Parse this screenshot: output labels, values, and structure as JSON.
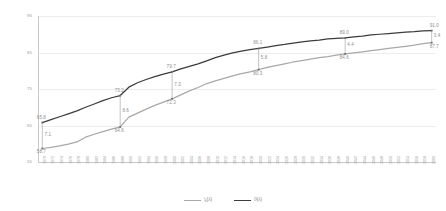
{
  "chart_data": {
    "type": "line",
    "title": "",
    "xlabel": "",
    "ylabel": "",
    "ylim": [
      55,
      95
    ],
    "yticks": [
      95,
      85,
      75,
      65,
      55
    ],
    "grid": true,
    "legend_position": "bottom-center",
    "x": [
      1970,
      1972,
      1974,
      1976,
      1978,
      1980,
      1982,
      1984,
      1986,
      1988,
      1990,
      1992,
      1994,
      1996,
      1998,
      2000,
      2002,
      2004,
      2006,
      2008,
      2010,
      2012,
      2014,
      2016,
      2018,
      2020,
      2022,
      2024,
      2026,
      2028,
      2030,
      2032,
      2034,
      2036,
      2038,
      2040,
      2042,
      2044,
      2046,
      2048,
      2050,
      2052,
      2054,
      2056,
      2058,
      2060
    ],
    "series": [
      {
        "name": "여자",
        "color": "#3c3c3c",
        "values": [
          65.8,
          66.6,
          67.4,
          68.2,
          69.0,
          70.0,
          70.9,
          71.8,
          72.6,
          73.2,
          75.5,
          76.7,
          77.6,
          78.4,
          79.1,
          79.7,
          80.5,
          81.2,
          81.9,
          82.7,
          83.6,
          84.3,
          84.9,
          85.4,
          85.8,
          86.1,
          86.5,
          86.9,
          87.2,
          87.6,
          87.9,
          88.2,
          88.4,
          88.7,
          88.9,
          89.0,
          89.3,
          89.5,
          89.8,
          90.0,
          90.2,
          90.4,
          90.6,
          90.7,
          90.9,
          91.0
        ]
      },
      {
        "name": "남자",
        "color": "#a8a8a8",
        "values": [
          58.7,
          59.0,
          59.4,
          59.9,
          60.5,
          61.8,
          62.6,
          63.3,
          64.0,
          64.6,
          67.3,
          68.4,
          69.5,
          70.5,
          71.4,
          72.3,
          73.4,
          74.5,
          75.4,
          76.5,
          77.2,
          77.9,
          78.6,
          79.2,
          79.7,
          80.3,
          80.9,
          81.4,
          81.9,
          82.4,
          82.8,
          83.2,
          83.6,
          83.9,
          84.3,
          84.6,
          84.9,
          85.2,
          85.5,
          85.8,
          86.1,
          86.4,
          86.7,
          87.0,
          87.4,
          87.7
        ]
      }
    ],
    "annotations": [
      {
        "year": 1970,
        "female": "65.8",
        "male": "58.7",
        "gap": "7.1"
      },
      {
        "year": 1988,
        "female": "73.2",
        "male": "64.6",
        "gap": "8.6"
      },
      {
        "year": 2000,
        "female": "79.7",
        "male": "72.3",
        "gap": "7.3"
      },
      {
        "year": 2020,
        "female": "86.1",
        "male": "80.3",
        "gap": "5.8"
      },
      {
        "year": 2040,
        "female": "89.0",
        "male": "84.6",
        "gap": "4.4"
      },
      {
        "year": 2060,
        "female": "91.0",
        "male": "87.7",
        "gap": "3.4"
      }
    ]
  },
  "legend": {
    "items": [
      {
        "label": "남자",
        "color": "#a8a8a8"
      },
      {
        "label": "여자",
        "color": "#3c3c3c"
      }
    ]
  },
  "colors": {
    "grid": "#ededed",
    "axis": "#c9c9c9",
    "tick_text": "#9a9a9a",
    "label_text": "#8e8e8e",
    "background": "#ffffff"
  }
}
